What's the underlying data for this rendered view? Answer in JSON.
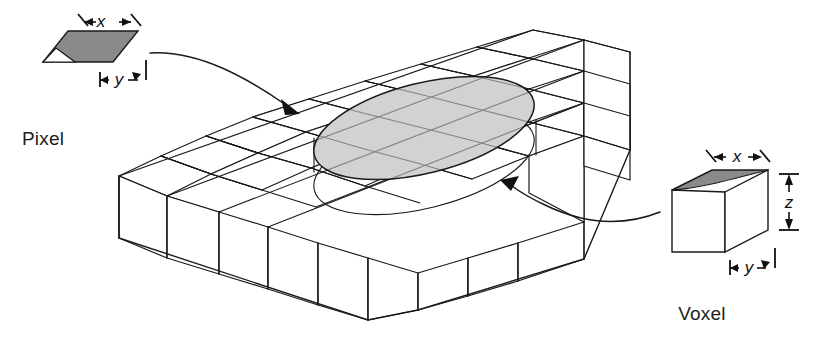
{
  "figure": {
    "title": "",
    "background_color": "#ffffff",
    "line_color": "#1a1a1a"
  },
  "captions": {
    "pixel": "Pixel",
    "voxel": "Voxel"
  },
  "pixel_callout": {
    "name": "pixel",
    "shape": "parallelogram",
    "fill_color": "#8a8a8a",
    "notch_color": "#ffffff",
    "dimensions": [
      {
        "axis": "x",
        "label": "x",
        "orientation": "along-top-edge"
      },
      {
        "axis": "y",
        "label": "y",
        "orientation": "along-right-edge"
      }
    ]
  },
  "voxel_callout": {
    "name": "voxel",
    "shape": "rectangular-box",
    "top_face_color": "#8a8a8a",
    "top_face_highlight_color": "#ffffff",
    "side_face_color": "#ffffff",
    "front_face_color": "#ffffff",
    "dimensions": [
      {
        "axis": "x",
        "label": "x",
        "orientation": "along-top-back-edge"
      },
      {
        "axis": "y",
        "label": "y",
        "orientation": "along-bottom-front-edge"
      },
      {
        "axis": "z",
        "label": "z",
        "orientation": "vertical-right-side"
      }
    ]
  },
  "slab": {
    "name": "image-grid-slab",
    "description": "isometric slab of grid cells",
    "grid_columns": 5,
    "grid_rows": 4,
    "cell_fill_color": "#ffffff",
    "edge_color": "#1a1a1a"
  },
  "cylinder": {
    "name": "voxel-column-cylinder",
    "top_ellipse_fill": "#d2d2d2",
    "description": "shaded elliptical region on slab top extending down through slab"
  },
  "leaders": [
    {
      "name": "pixel-leader",
      "from": "pixel",
      "to": "slab-top-ellipse",
      "arrow": "right"
    },
    {
      "name": "voxel-leader",
      "from": "voxel",
      "to": "cylinder-body",
      "arrow": "left"
    }
  ]
}
